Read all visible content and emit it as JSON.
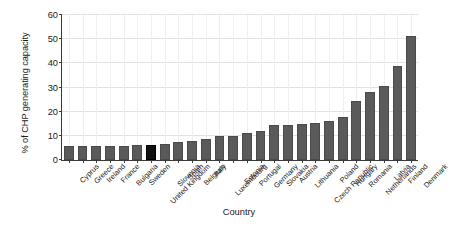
{
  "chart_data": {
    "type": "bar",
    "title": "",
    "xlabel": "Country",
    "ylabel": "% of CHP generating capacity",
    "ylim": [
      0,
      60
    ],
    "ytick_values": [
      0,
      10,
      20,
      30,
      40,
      50,
      60
    ],
    "ytick_labels": [
      "0",
      "10",
      "20",
      "30",
      "40",
      "50",
      "60"
    ],
    "grid": true,
    "legend": "none",
    "bar_color": "#5a5a5a",
    "highlight_color": "#111111",
    "highlight_category": "United Kingdom",
    "categories": [
      "Cyprus",
      "Greece",
      "Ireland",
      "France",
      "Bulgaria",
      "Sweden",
      "United Kingdom",
      "Slovenia",
      "Spain",
      "Belgium",
      "Italy",
      "Luxembourg",
      "Estonia",
      "Portugal",
      "Germany",
      "Slovakia",
      "Austria",
      "Lithuania",
      "Czech Republic",
      "Poland",
      "Hungary",
      "Romania",
      "Netherlands",
      "Latvia",
      "Finland",
      "Denmark"
    ],
    "values": [
      5.6,
      5.7,
      5.8,
      5.9,
      6.0,
      6.3,
      6.4,
      6.8,
      7.4,
      8.0,
      8.6,
      9.8,
      9.9,
      11.2,
      11.8,
      14.3,
      14.6,
      14.9,
      15.2,
      16.0,
      18.0,
      24.5,
      28.0,
      30.5,
      38.8,
      51.5
    ]
  }
}
